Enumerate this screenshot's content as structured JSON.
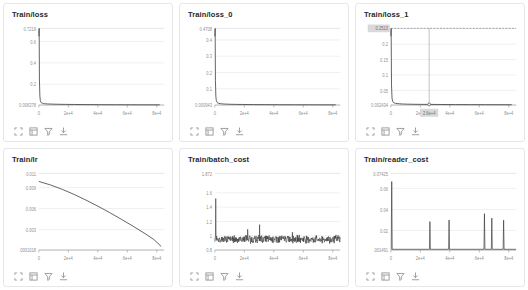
{
  "page": {
    "background": "#ffffff",
    "card_border": "#e4e6e8",
    "line_color": "#333333",
    "grid_color": "#e8e8e8",
    "axis_color": "#999999",
    "tick_text_color": "#8a8f94",
    "title_color": "#26282b",
    "highlight_bg": "#d9d9d9",
    "crosshair_color": "#9aa0a6"
  },
  "toolbar": {
    "icons": [
      {
        "name": "fullscreen-icon",
        "label": "Fullscreen"
      },
      {
        "name": "restore-size-icon",
        "label": "Restore size"
      },
      {
        "name": "filter-icon",
        "label": "Filter"
      },
      {
        "name": "download-icon",
        "label": "Download"
      }
    ]
  },
  "panels": [
    {
      "id": "train-loss",
      "title": "Train/loss",
      "chart_data": {
        "type": "line",
        "title": "Train/loss",
        "xlabel": "",
        "ylabel": "",
        "grid": true,
        "legend": "none",
        "xlim": [
          0,
          85000
        ],
        "ylim": [
          0.006378,
          0.7219
        ],
        "xticks": [
          "0",
          "2e+4",
          "4e+4",
          "6e+4",
          "8e+4"
        ],
        "xtick_values": [
          0,
          20000,
          40000,
          60000,
          80000
        ],
        "yticks": [
          "0.7219",
          "0.6",
          "0.4",
          "0.2",
          "0.006378"
        ],
        "ytick_values": [
          0.7219,
          0.6,
          0.4,
          0.2,
          0.006378
        ],
        "series": [
          {
            "name": "Train/loss",
            "x": [
              0,
              200,
              400,
              700,
              1000,
              1400,
              1800,
              2400,
              3000,
              4000,
              6000,
              9000,
              13000,
              18000,
              24000,
              32000,
              42000,
              52000,
              62000,
              72000,
              82000
            ],
            "values": [
              0.648,
              0.7219,
              0.24,
              0.09,
              0.048,
              0.033,
              0.027,
              0.023,
              0.0205,
              0.0185,
              0.0165,
              0.015,
              0.0135,
              0.0125,
              0.0115,
              0.0105,
              0.0098,
              0.0092,
              0.0088,
              0.0084,
              0.0082
            ]
          }
        ]
      }
    },
    {
      "id": "train-loss-0",
      "title": "Train/loss_0",
      "chart_data": {
        "type": "line",
        "title": "Train/loss_0",
        "xlabel": "",
        "ylabel": "",
        "grid": true,
        "legend": "none",
        "xlim": [
          0,
          85000
        ],
        "ylim": [
          0.000943,
          0.4708
        ],
        "xticks": [
          "0",
          "2e+4",
          "4e+4",
          "6e+4",
          "8e+4"
        ],
        "xtick_values": [
          0,
          20000,
          40000,
          60000,
          80000
        ],
        "yticks": [
          "0.4708",
          "0.4",
          "0.3",
          "0.2",
          "0.1",
          "0.000943"
        ],
        "ytick_values": [
          0.4708,
          0.4,
          0.3,
          0.2,
          0.1,
          0.000943
        ],
        "series": [
          {
            "name": "Train/loss_0",
            "x": [
              0,
              200,
              400,
              700,
              1000,
              1500,
              2000,
              2800,
              3600,
              5000,
              7000,
              10000,
              14000,
              19000,
              26000,
              34000,
              44000,
              54000,
              64000,
              74000,
              82000
            ],
            "values": [
              0.422,
              0.4708,
              0.15,
              0.052,
              0.029,
              0.0175,
              0.0135,
              0.011,
              0.0095,
              0.008,
              0.0068,
              0.0058,
              0.005,
              0.0044,
              0.0038,
              0.0033,
              0.0029,
              0.0026,
              0.0024,
              0.0022,
              0.0021
            ]
          }
        ]
      }
    },
    {
      "id": "train-loss-1",
      "title": "Train/loss_1",
      "highlight": {
        "y_label": "0.2513",
        "x_label": "2.6e+4",
        "crosshair_x": 26000,
        "point_y": 0.0045
      },
      "chart_data": {
        "type": "line",
        "title": "Train/loss_1",
        "xlabel": "",
        "ylabel": "",
        "grid": true,
        "legend": "none",
        "xlim": [
          0,
          85000
        ],
        "ylim": [
          0.002434,
          0.2513
        ],
        "xticks": [
          "0",
          "2e+4",
          "4e+4",
          "6e+4",
          "8e+4"
        ],
        "xtick_values": [
          0,
          20000,
          40000,
          60000,
          80000
        ],
        "yticks": [
          "0.2513",
          "0.2",
          "0.15",
          "0.1",
          "0.05",
          "0.002434"
        ],
        "ytick_values": [
          0.2513,
          0.2,
          0.15,
          0.1,
          0.05,
          0.002434
        ],
        "series": [
          {
            "name": "Train/loss_1",
            "x": [
              0,
              200,
              450,
              800,
              1200,
              1700,
              2300,
              3100,
              4200,
              5800,
              8000,
              11000,
              15000,
              20000,
              26000,
              34000,
              44000,
              54000,
              64000,
              74000,
              82000
            ],
            "values": [
              0.226,
              0.2513,
              0.068,
              0.025,
              0.015,
              0.011,
              0.0092,
              0.008,
              0.0072,
              0.0065,
              0.0058,
              0.0053,
              0.0049,
              0.0046,
              0.0045,
              0.0042,
              0.0039,
              0.0037,
              0.0036,
              0.0035,
              0.0034
            ]
          }
        ]
      }
    },
    {
      "id": "train-lr",
      "title": "Train/lr",
      "chart_data": {
        "type": "line",
        "title": "Train/lr",
        "xlabel": "",
        "ylabel": "",
        "grid": true,
        "legend": "none",
        "xlim": [
          0,
          85000
        ],
        "ylim": [
          0.0001018,
          0.011
        ],
        "xticks": [
          "0",
          "2e+4",
          "4e+4",
          "6e+4",
          "8e+4"
        ],
        "xtick_values": [
          0,
          20000,
          40000,
          60000,
          80000
        ],
        "yticks": [
          "0.011",
          "0.009",
          "0.006",
          "0.003",
          ".0001018"
        ],
        "ytick_values": [
          0.011,
          0.009,
          0.006,
          0.003,
          0.0001018
        ],
        "series": [
          {
            "name": "Train/lr",
            "x": [
              0,
              8000,
              16000,
              24000,
              32000,
              40000,
              48000,
              56000,
              64000,
              72000,
              78000,
              83000
            ],
            "values": [
              0.00985,
              0.00935,
              0.00872,
              0.008,
              0.0072,
              0.00634,
              0.00543,
              0.00447,
              0.00348,
              0.00244,
              0.0016,
              0.00062
            ]
          }
        ]
      }
    },
    {
      "id": "train-batch-cost",
      "title": "Train/batch_cost",
      "chart_data": {
        "type": "line",
        "title": "Train/batch_cost",
        "xlabel": "",
        "ylabel": "",
        "grid": true,
        "legend": "none",
        "xlim": [
          0,
          85000
        ],
        "ylim": [
          0.8,
          1.872
        ],
        "xticks": [
          "0",
          "2e+4",
          "4e+4",
          "6e+4",
          "8e+4"
        ],
        "xtick_values": [
          0,
          20000,
          40000,
          60000,
          80000
        ],
        "yticks": [
          "1.872",
          "1.6",
          "1.4",
          "1.2",
          "1",
          "0.8"
        ],
        "ytick_values": [
          1.872,
          1.6,
          1.4,
          1.2,
          1.0,
          0.8
        ],
        "noise": {
          "mean": 0.952,
          "amplitude": 0.045,
          "spike_x": 700,
          "spike_y": 1.52
        },
        "series": [
          {
            "name": "Train/batch_cost",
            "note": "dense noisy band centered near 0.95 with an initial spike to 1.52 and occasional spikes near 1.05-1.15"
          }
        ]
      }
    },
    {
      "id": "train-reader-cost",
      "title": "Train/reader_cost",
      "chart_data": {
        "type": "line",
        "title": "Train/reader_cost",
        "xlabel": "",
        "ylabel": "",
        "grid": true,
        "legend": "none",
        "xlim": [
          0,
          85000
        ],
        "ylim": [
          0.001491,
          0.07425
        ],
        "xticks": [
          "0",
          "2e+4",
          "4e+4",
          "6e+4",
          "8e+4"
        ],
        "xtick_values": [
          0,
          20000,
          40000,
          60000,
          80000
        ],
        "yticks": [
          "0.07425",
          "0.06",
          "0.04",
          "0.02",
          ".001491"
        ],
        "ytick_values": [
          0.07425,
          0.06,
          0.04,
          0.02,
          0.001491
        ],
        "baseline": 0.0022,
        "spikes": [
          {
            "x": 600,
            "y": 0.0665
          },
          {
            "x": 26500,
            "y": 0.0285
          },
          {
            "x": 39500,
            "y": 0.03
          },
          {
            "x": 63500,
            "y": 0.036
          },
          {
            "x": 68500,
            "y": 0.0318
          },
          {
            "x": 76500,
            "y": 0.0298
          }
        ],
        "series": [
          {
            "name": "Train/reader_cost",
            "note": "near-zero baseline punctuated by six narrow spikes"
          }
        ]
      }
    }
  ]
}
